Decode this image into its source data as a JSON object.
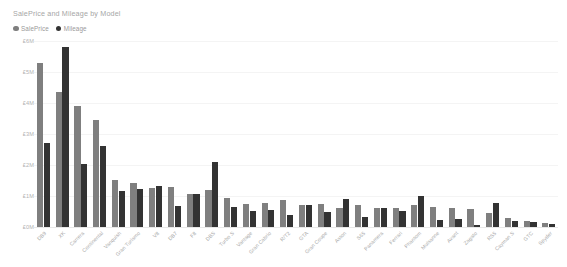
{
  "chart": {
    "title": "SalePrice and Mileage by Model",
    "legend": [
      {
        "label": "SalePrice",
        "color": "#7f7f7f",
        "icon": "legend-dot-icon"
      },
      {
        "label": "Mileage",
        "color": "#333333",
        "icon": "legend-dot-icon"
      }
    ]
  },
  "chart_data": {
    "type": "bar",
    "title": "SalePrice and Mileage by Model",
    "xlabel": "",
    "ylabel": "",
    "ylim": [
      0,
      6
    ],
    "ytick_labels": [
      "£6M",
      "£5M",
      "£4M",
      "£3M",
      "£2M",
      "£1M",
      "£0M"
    ],
    "ytick_values": [
      6,
      5,
      4,
      3,
      2,
      1,
      0
    ],
    "grid": true,
    "legend_position": "top-left",
    "categories": [
      "DB9",
      "XK",
      "Carrera",
      "Continental",
      "Vanquish",
      "Gran Turismo",
      "V8",
      "DB7",
      "F8",
      "DBS",
      "Turbo S",
      "Vantage",
      "Gran Cabrio",
      "R/T2",
      "GTA",
      "Gran Coupe",
      "Aston",
      "S65",
      "Panamera",
      "Ferrari",
      "Phantom",
      "Mulsanne",
      "Avant",
      "Zagato",
      "RS5",
      "Cayman S",
      "GTC",
      "Spyder"
    ],
    "series": [
      {
        "name": "SalePrice",
        "color": "#7f7f7f",
        "values": [
          5.3,
          4.35,
          3.9,
          3.45,
          1.52,
          1.42,
          1.25,
          1.3,
          1.05,
          1.2,
          0.92,
          0.73,
          0.78,
          0.86,
          0.7,
          0.73,
          0.62,
          0.7,
          0.62,
          0.6,
          0.7,
          0.65,
          0.6,
          0.59,
          0.44,
          0.3,
          0.21,
          0.13
        ]
      },
      {
        "name": "Mileage",
        "color": "#333333",
        "values": [
          2.72,
          5.8,
          2.02,
          2.6,
          1.15,
          1.22,
          1.32,
          0.68,
          1.05,
          2.1,
          0.65,
          0.52,
          0.55,
          0.38,
          0.72,
          0.5,
          0.91,
          0.31,
          0.6,
          0.52,
          1.0,
          0.24,
          0.26,
          0.05,
          0.78,
          0.2,
          0.15,
          0.1
        ]
      }
    ]
  }
}
